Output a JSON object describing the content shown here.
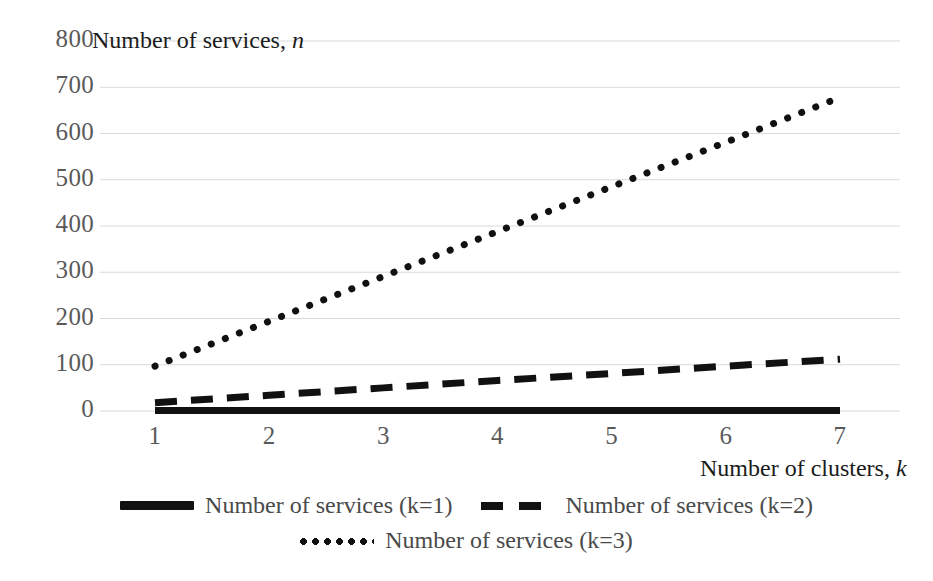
{
  "chart_data": {
    "type": "line",
    "title": "",
    "xlabel": "Number of clusters, k",
    "ylabel": "Number of services, n",
    "xlabel_text": "Number of clusters, ",
    "xlabel_italic": "k",
    "ylabel_text": "Number of services, ",
    "ylabel_italic": "n",
    "x": [
      1,
      2,
      3,
      4,
      5,
      6,
      7
    ],
    "xlim": [
      1,
      7
    ],
    "ylim": [
      0,
      800
    ],
    "xticks": [
      "1",
      "2",
      "3",
      "4",
      "5",
      "6",
      "7"
    ],
    "yticks": [
      "0",
      "100",
      "200",
      "300",
      "400",
      "500",
      "600",
      "700",
      "800"
    ],
    "ytick_values": [
      0,
      100,
      200,
      300,
      400,
      500,
      600,
      700,
      800
    ],
    "grid": "horizontal",
    "grid_color": "#d9d9d9",
    "legend_position": "bottom",
    "series": [
      {
        "name": "Number of services (k=1)",
        "style": "solid",
        "color": "#111111",
        "width": 7,
        "values": [
          1,
          1,
          1,
          1,
          1,
          1,
          1
        ]
      },
      {
        "name": "Number of services (k=2)",
        "style": "dashed",
        "color": "#111111",
        "width": 7,
        "values": [
          18,
          34,
          50,
          66,
          81,
          97,
          112
        ]
      },
      {
        "name": "Number of services (k=3)",
        "style": "dotted",
        "color": "#111111",
        "width": 7,
        "values": [
          97,
          194,
          291,
          388,
          485,
          581,
          678
        ]
      }
    ]
  },
  "legend": {
    "rows": [
      [
        {
          "marker": "solid",
          "label": "Number of services (k=1)"
        },
        {
          "marker": "dashed",
          "label": "Number of services (k=2)"
        }
      ],
      [
        {
          "marker": "dotted",
          "label": "Number of services (k=3)"
        }
      ]
    ]
  },
  "colors": {
    "line": "#111111",
    "grid": "#d9d9d9",
    "tick_text": "#5a5a5a",
    "title_text": "#1b1b1b",
    "background": "#ffffff"
  }
}
